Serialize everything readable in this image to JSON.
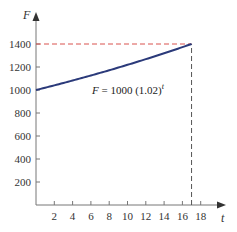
{
  "chart_data": {
    "type": "line",
    "title": "",
    "xlabel": "t",
    "ylabel": "F",
    "xlim": [
      0,
      20
    ],
    "ylim": [
      0,
      1500
    ],
    "x_ticks": [
      2,
      4,
      6,
      8,
      10,
      12,
      14,
      16,
      18
    ],
    "y_ticks": [
      200,
      400,
      600,
      800,
      1000,
      1200,
      1400
    ],
    "grid": false,
    "series": [
      {
        "name": "F = 1000 (1.02)^t",
        "x": [
          0,
          2,
          4,
          6,
          8,
          10,
          12,
          14,
          16,
          17
        ],
        "values": [
          1000,
          1040,
          1082,
          1126,
          1172,
          1219,
          1268,
          1319,
          1373,
          1400
        ],
        "color": "#2b3a7a"
      }
    ],
    "annotations": [
      {
        "type": "hline-dashed",
        "y": 1400,
        "x_from": 0,
        "x_to": 17,
        "color": "#d9534f"
      },
      {
        "type": "vline-dashed",
        "x": 17,
        "y_from": 0,
        "y_to": 1400,
        "color": "#555555"
      },
      {
        "type": "label",
        "text": "F = 1000 (1.02)",
        "superscript": "t",
        "x": 9.5,
        "y": 1100
      }
    ]
  },
  "labels": {
    "y_axis": "F",
    "x_axis": "t",
    "equation": "F = 1000 (1.02)",
    "equation_exp": "t"
  }
}
